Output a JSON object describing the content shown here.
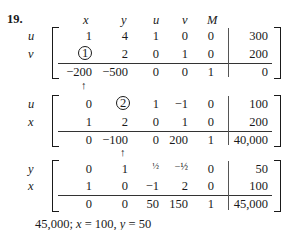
{
  "problem_number": "19.",
  "column_headers": [
    "x",
    "y",
    "u",
    "v",
    "M"
  ],
  "tableaux": [
    {
      "row_labels": [
        "u",
        "v"
      ],
      "rows": [
        [
          "1",
          "4",
          "1",
          "0",
          "0",
          "300"
        ],
        [
          "1",
          "2",
          "0",
          "1",
          "0",
          "200"
        ]
      ],
      "objective_row": [
        "−200",
        "−500",
        "0",
        "0",
        "1",
        "0"
      ],
      "pivot": {
        "row": 1,
        "col": 0,
        "value": "1"
      },
      "pivot_column_arrow_under": "x"
    },
    {
      "row_labels": [
        "u",
        "x"
      ],
      "rows": [
        [
          "0",
          "2",
          "1",
          "−1",
          "0",
          "100"
        ],
        [
          "1",
          "2",
          "0",
          "1",
          "0",
          "200"
        ]
      ],
      "objective_row": [
        "0",
        "−100",
        "0",
        "200",
        "1",
        "40,000"
      ],
      "pivot": {
        "row": 0,
        "col": 1,
        "value": "2"
      },
      "pivot_column_arrow_under": "y"
    },
    {
      "row_labels": [
        "y",
        "x"
      ],
      "rows": [
        [
          "0",
          "1",
          "½",
          "−½",
          "0",
          "50"
        ],
        [
          "1",
          "0",
          "−1",
          "2",
          "0",
          "100"
        ]
      ],
      "objective_row": [
        "0",
        "0",
        "50",
        "150",
        "1",
        "45,000"
      ]
    }
  ],
  "answer": "45,000; x = 100, y = 50",
  "answer_parts": {
    "value": "45,000;",
    "x_label": "x",
    "x_eq": " = 100, ",
    "y_label": "y",
    "y_eq": " = 50"
  }
}
